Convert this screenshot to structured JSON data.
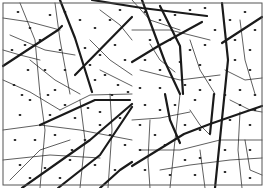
{
  "figure": {
    "colors": {
      "background": "#ffffff",
      "ink": "#1a1a1a",
      "frame": "#555555"
    },
    "frame": {
      "x": 3,
      "y": 3,
      "w": 259,
      "h": 182
    },
    "thick_lines": [
      [
        [
          3,
          66
        ],
        [
          58,
          30
        ],
        [
          62,
          26
        ]
      ],
      [
        [
          60,
          0
        ],
        [
          75,
          38
        ],
        [
          92,
          92
        ]
      ],
      [
        [
          92,
          0
        ],
        [
          142,
          8
        ],
        [
          207,
          16
        ]
      ],
      [
        [
          142,
          0
        ],
        [
          165,
          62
        ],
        [
          180,
          94
        ]
      ],
      [
        [
          222,
          3
        ],
        [
          228,
          60
        ],
        [
          215,
          188
        ]
      ],
      [
        [
          222,
          43
        ],
        [
          262,
          17
        ]
      ],
      [
        [
          40,
          125
        ],
        [
          95,
          100
        ],
        [
          130,
          100
        ]
      ],
      [
        [
          22,
          188
        ],
        [
          90,
          140
        ],
        [
          132,
          104
        ]
      ],
      [
        [
          58,
          188
        ],
        [
          100,
          155
        ],
        [
          132,
          107
        ]
      ],
      [
        [
          100,
          188
        ],
        [
          120,
          170
        ],
        [
          132,
          162
        ]
      ],
      [
        [
          75,
          75
        ],
        [
          132,
          17
        ]
      ],
      [
        [
          132,
          62
        ],
        [
          160,
          45
        ],
        [
          202,
          22
        ]
      ],
      [
        [
          160,
          6
        ],
        [
          180,
          46
        ],
        [
          183,
          94
        ]
      ],
      [
        [
          132,
          166
        ],
        [
          184,
          134
        ],
        [
          210,
          124
        ],
        [
          262,
          106
        ]
      ],
      [
        [
          165,
          94
        ],
        [
          170,
          120
        ],
        [
          180,
          143
        ]
      ],
      [
        [
          214,
          94
        ],
        [
          210,
          134
        ]
      ]
    ],
    "thin_lines": [
      [
        [
          3,
          18
        ],
        [
          30,
          22
        ],
        [
          60,
          30
        ]
      ],
      [
        [
          20,
          3
        ],
        [
          35,
          40
        ],
        [
          40,
          94
        ]
      ],
      [
        [
          10,
          35
        ],
        [
          45,
          50
        ],
        [
          75,
          55
        ]
      ],
      [
        [
          3,
          80
        ],
        [
          30,
          92
        ],
        [
          60,
          110
        ]
      ],
      [
        [
          30,
          60
        ],
        [
          55,
          80
        ],
        [
          80,
          94
        ]
      ],
      [
        [
          55,
          3
        ],
        [
          60,
          40
        ],
        [
          70,
          94
        ]
      ],
      [
        [
          100,
          10
        ],
        [
          120,
          25
        ],
        [
          132,
          40
        ]
      ],
      [
        [
          90,
          40
        ],
        [
          110,
          60
        ],
        [
          132,
          75
        ]
      ],
      [
        [
          100,
          70
        ],
        [
          120,
          80
        ],
        [
          132,
          86
        ]
      ],
      [
        [
          3,
          130
        ],
        [
          40,
          125
        ],
        [
          80,
          130
        ],
        [
          132,
          140
        ]
      ],
      [
        [
          3,
          160
        ],
        [
          50,
          155
        ],
        [
          100,
          158
        ]
      ],
      [
        [
          10,
          180
        ],
        [
          40,
          150
        ],
        [
          70,
          140
        ]
      ],
      [
        [
          40,
          94
        ],
        [
          45,
          130
        ],
        [
          40,
          188
        ]
      ],
      [
        [
          80,
          100
        ],
        [
          85,
          140
        ],
        [
          80,
          188
        ]
      ],
      [
        [
          110,
          94
        ],
        [
          112,
          130
        ],
        [
          108,
          188
        ]
      ],
      [
        [
          132,
          30
        ],
        [
          170,
          30
        ],
        [
          210,
          40
        ]
      ],
      [
        [
          140,
          70
        ],
        [
          180,
          80
        ],
        [
          220,
          75
        ]
      ],
      [
        [
          190,
          40
        ],
        [
          200,
          70
        ],
        [
          215,
          94
        ]
      ],
      [
        [
          225,
          70
        ],
        [
          245,
          80
        ],
        [
          262,
          78
        ]
      ],
      [
        [
          230,
          100
        ],
        [
          250,
          110
        ],
        [
          262,
          112
        ]
      ],
      [
        [
          240,
          20
        ],
        [
          245,
          60
        ],
        [
          255,
          94
        ]
      ],
      [
        [
          132,
          120
        ],
        [
          160,
          118
        ],
        [
          190,
          112
        ]
      ],
      [
        [
          140,
          150
        ],
        [
          180,
          150
        ],
        [
          220,
          140
        ],
        [
          262,
          140
        ]
      ],
      [
        [
          160,
          170
        ],
        [
          190,
          165
        ],
        [
          230,
          160
        ],
        [
          262,
          158
        ]
      ],
      [
        [
          180,
          94
        ],
        [
          175,
          140
        ],
        [
          170,
          188
        ]
      ],
      [
        [
          240,
          112
        ],
        [
          238,
          150
        ],
        [
          242,
          188
        ]
      ],
      [
        [
          150,
          120
        ],
        [
          148,
          160
        ],
        [
          150,
          188
        ]
      ],
      [
        [
          200,
          150
        ],
        [
          205,
          188
        ]
      ],
      [
        [
          132,
          0
        ],
        [
          150,
          20
        ],
        [
          180,
          30
        ]
      ],
      [
        [
          60,
          110
        ],
        [
          90,
          95
        ],
        [
          132,
          94
        ]
      ],
      [
        [
          3,
          50
        ],
        [
          20,
          55
        ],
        [
          40,
          60
        ]
      ],
      [
        [
          150,
          44
        ],
        [
          160,
          60
        ],
        [
          175,
          72
        ]
      ],
      [
        [
          190,
          110
        ],
        [
          200,
          125
        ],
        [
          210,
          135
        ]
      ],
      [
        [
          245,
          140
        ],
        [
          250,
          170
        ],
        [
          262,
          175
        ]
      ]
    ],
    "dots": [
      [
        18,
        12
      ],
      [
        30,
        28
      ],
      [
        25,
        45
      ],
      [
        40,
        40
      ],
      [
        50,
        15
      ],
      [
        65,
        12
      ],
      [
        80,
        20
      ],
      [
        95,
        28
      ],
      [
        110,
        20
      ],
      [
        120,
        10
      ],
      [
        12,
        50
      ],
      [
        28,
        70
      ],
      [
        45,
        70
      ],
      [
        60,
        50
      ],
      [
        85,
        48
      ],
      [
        100,
        55
      ],
      [
        115,
        45
      ],
      [
        125,
        60
      ],
      [
        14,
        85
      ],
      [
        30,
        100
      ],
      [
        55,
        90
      ],
      [
        65,
        105
      ],
      [
        95,
        80
      ],
      [
        105,
        75
      ],
      [
        118,
        85
      ],
      [
        128,
        92
      ],
      [
        20,
        115
      ],
      [
        50,
        115
      ],
      [
        75,
        118
      ],
      [
        100,
        112
      ],
      [
        120,
        118
      ],
      [
        15,
        140
      ],
      [
        35,
        140
      ],
      [
        55,
        135
      ],
      [
        85,
        140
      ],
      [
        110,
        135
      ],
      [
        125,
        145
      ],
      [
        20,
        165
      ],
      [
        45,
        168
      ],
      [
        70,
        160
      ],
      [
        95,
        165
      ],
      [
        115,
        170
      ],
      [
        30,
        178
      ],
      [
        60,
        178
      ],
      [
        145,
        12
      ],
      [
        160,
        20
      ],
      [
        175,
        15
      ],
      [
        190,
        10
      ],
      [
        205,
        8
      ],
      [
        215,
        30
      ],
      [
        150,
        40
      ],
      [
        170,
        40
      ],
      [
        190,
        50
      ],
      [
        205,
        45
      ],
      [
        230,
        20
      ],
      [
        245,
        12
      ],
      [
        255,
        30
      ],
      [
        235,
        40
      ],
      [
        250,
        50
      ],
      [
        145,
        60
      ],
      [
        160,
        70
      ],
      [
        180,
        62
      ],
      [
        200,
        65
      ],
      [
        210,
        80
      ],
      [
        235,
        60
      ],
      [
        250,
        70
      ],
      [
        240,
        90
      ],
      [
        255,
        95
      ],
      [
        140,
        88
      ],
      [
        160,
        88
      ],
      [
        185,
        85
      ],
      [
        200,
        90
      ],
      [
        225,
        95
      ],
      [
        145,
        105
      ],
      [
        160,
        110
      ],
      [
        175,
        105
      ],
      [
        195,
        100
      ],
      [
        240,
        105
      ],
      [
        255,
        110
      ],
      [
        140,
        125
      ],
      [
        155,
        135
      ],
      [
        185,
        125
      ],
      [
        200,
        130
      ],
      [
        230,
        120
      ],
      [
        250,
        125
      ],
      [
        140,
        150
      ],
      [
        165,
        145
      ],
      [
        185,
        160
      ],
      [
        200,
        158
      ],
      [
        225,
        150
      ],
      [
        250,
        150
      ],
      [
        145,
        170
      ],
      [
        170,
        175
      ],
      [
        195,
        175
      ],
      [
        225,
        172
      ],
      [
        250,
        178
      ],
      [
        65,
        70
      ],
      [
        90,
        65
      ],
      [
        112,
        95
      ],
      [
        72,
        150
      ],
      [
        100,
        125
      ],
      [
        22,
        95
      ],
      [
        48,
        95
      ],
      [
        88,
        108
      ]
    ]
  }
}
